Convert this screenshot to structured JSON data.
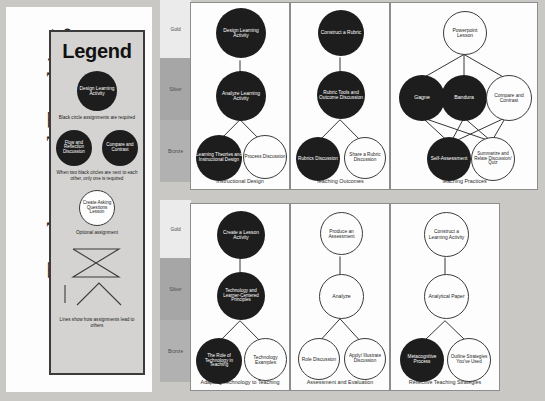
{
  "doc": {
    "title": "Teachers and Teaching",
    "background_color": "#c9c8c4"
  },
  "legend": {
    "title": "Legend",
    "required_example": "Design Learning Activity",
    "required_caption": "Black circle assignments are required",
    "pair_example_left": "Flow and Reflection Discussion",
    "pair_example_right": "Compare and Contrast",
    "pair_caption": "When two black circles are next to each other, only one is required",
    "optional_example": "Create Asking Questions Lesson",
    "optional_caption": "Optional assignment",
    "lines_caption": "Lines show how assignments lead to others"
  },
  "medals": {
    "gold": "Gold",
    "silver": "Silver",
    "bronze": "Bronze",
    "gold_color": "#ebebeb",
    "silver_color": "#a6a6a6",
    "bronze_color": "#b1b1b1"
  },
  "colors": {
    "required_fill": "#1d1d1d",
    "optional_fill": "#fdfdfd",
    "stroke": "#3b3b3b"
  },
  "panels": [
    {
      "id": "instructional-design",
      "label": "Instructional Design",
      "nodes": [
        {
          "text": "Design Learning Activity",
          "style": "required"
        },
        {
          "text": "Analyze Learning Activity",
          "style": "required"
        },
        {
          "text": "Learning Theories and Instructional Design",
          "style": "required"
        },
        {
          "text": "Process Discussion",
          "style": "optional"
        }
      ]
    },
    {
      "id": "teaching-outcomes",
      "label": "Teaching Outcomes",
      "nodes": [
        {
          "text": "Construct a Rubric",
          "style": "required"
        },
        {
          "text": "Rubric Tools and Outcome Discussion",
          "style": "required"
        },
        {
          "text": "Rubrics Discussion",
          "style": "required"
        },
        {
          "text": "Share a Rubric Discussion",
          "style": "optional"
        }
      ]
    },
    {
      "id": "teaching-practices",
      "label": "Teaching Practices",
      "nodes": [
        {
          "text": "Powerpoint Lesson",
          "style": "optional"
        },
        {
          "text": "Gagne",
          "style": "required"
        },
        {
          "text": "Bandura",
          "style": "required"
        },
        {
          "text": "Compare and Contrast",
          "style": "optional"
        },
        {
          "text": "Self-Assessment",
          "style": "required"
        },
        {
          "text": "Summarize and Relate Discussion/ Quiz",
          "style": "optional"
        }
      ]
    },
    {
      "id": "adapting-technology-to-teaching",
      "label": "Adapting Technology to Teaching",
      "nodes": [
        {
          "text": "Create a Lesson Activity",
          "style": "required"
        },
        {
          "text": "Technology and Learner-Centered Principles",
          "style": "required"
        },
        {
          "text": "The Role of Technology in Teaching",
          "style": "required"
        },
        {
          "text": "Technology Examples",
          "style": "optional"
        }
      ]
    },
    {
      "id": "assessment-and-evaluation",
      "label": "Assessment and Evaluation",
      "nodes": [
        {
          "text": "Produce an Assessment",
          "style": "optional"
        },
        {
          "text": "Analyze",
          "style": "optional"
        },
        {
          "text": "Role Discussion",
          "style": "optional"
        },
        {
          "text": "Apply/ Illustrate Discussion",
          "style": "optional"
        }
      ]
    },
    {
      "id": "reflective-teaching-strategies",
      "label": "Reflective Teaching Strategies",
      "nodes": [
        {
          "text": "Construct a Learning Activity",
          "style": "optional"
        },
        {
          "text": "Analytical Paper",
          "style": "optional"
        },
        {
          "text": "Metacognitive Process",
          "style": "required"
        },
        {
          "text": "Outline Strategies You've Used",
          "style": "optional"
        }
      ]
    }
  ]
}
